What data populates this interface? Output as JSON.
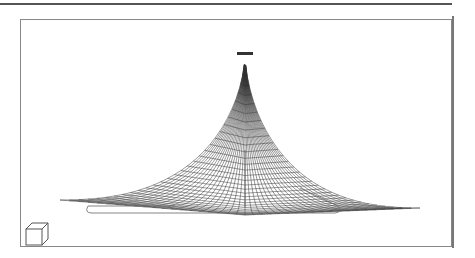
{
  "window": {
    "type": "3d-viewport",
    "background": "#ffffff",
    "frame_color": "#888888",
    "topbar_color": "#555555"
  },
  "scene": {
    "object": "wireframe-surface",
    "shape": "peaked tent / cone surface",
    "mesh_color": "#333333",
    "grid_u": 30,
    "grid_v": 40,
    "peak": {
      "x": 245,
      "y": 55
    },
    "base_left": {
      "x": 60,
      "y": 200
    },
    "base_right": {
      "x": 420,
      "y": 208
    },
    "base_front": {
      "x": 245,
      "y": 215
    },
    "base_plate_color": "#666666"
  },
  "view_cube": {
    "icon": "view-cube-icon",
    "color": "#555555"
  }
}
